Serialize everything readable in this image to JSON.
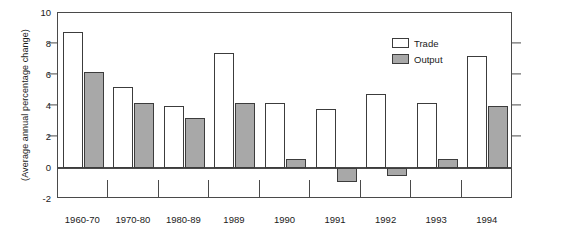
{
  "chart_data": {
    "type": "bar",
    "title": "",
    "subtitle": "",
    "xlabel": "",
    "ylabel": "(Average annual percentage change)",
    "ylim": [
      -2,
      10
    ],
    "ytick_values": [
      10,
      8,
      6,
      4,
      2,
      0,
      -2
    ],
    "ytick_labels": [
      "10",
      "8",
      "6",
      "4",
      "2",
      "0",
      "-2"
    ],
    "grid": false,
    "legend_position": "top-right",
    "categories": [
      "1960-70",
      "1970-80",
      "1980-89",
      "1989",
      "1990",
      "1991",
      "1992",
      "1993",
      "1994"
    ],
    "series": [
      {
        "name": "Trade",
        "color": "#ffffff",
        "values": [
          8.8,
          5.2,
          4.0,
          7.4,
          4.2,
          3.8,
          4.8,
          4.2,
          7.2
        ]
      },
      {
        "name": "Output",
        "color": "#a8a8a8",
        "values": [
          6.2,
          4.2,
          3.2,
          4.2,
          0.6,
          -0.9,
          -0.5,
          0.6,
          4.0
        ]
      }
    ]
  },
  "legend": {
    "entries": [
      {
        "label": "Trade",
        "swatch": "trade"
      },
      {
        "label": "Output",
        "swatch": "output"
      }
    ]
  }
}
